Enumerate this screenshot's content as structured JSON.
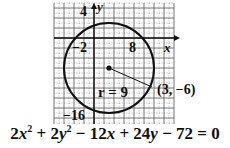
{
  "graph": {
    "pixel_box": {
      "left": 54,
      "top": 3,
      "right": 174,
      "bottom": 124
    },
    "x_range": [
      -8,
      16
    ],
    "y_range": [
      -17,
      7
    ],
    "unit_px": 5,
    "axis_origin_px": {
      "x": 94,
      "y": 38
    },
    "axis_labels": {
      "x": "x",
      "y": "y"
    },
    "tick_labels": [
      {
        "text": "4",
        "axis": "y",
        "value": 4
      },
      {
        "text": "−2",
        "axis": "x",
        "value": -2
      },
      {
        "text": "8",
        "axis": "x",
        "value": 8
      },
      {
        "text": "−16",
        "axis": "y",
        "value": -16
      }
    ],
    "circle": {
      "center": [
        3,
        -6
      ],
      "radius": 9,
      "color": "#111111"
    },
    "radius_label": "r = 9",
    "point_label": "(3, −6)",
    "radius_endpoint_px": [
      152,
      87
    ]
  },
  "equation": {
    "terms": [
      {
        "coef": "2",
        "var": "x",
        "exp": "2"
      },
      {
        "op": " + ",
        "coef": "2",
        "var": "y",
        "exp": "2"
      },
      {
        "op": " − ",
        "coef": "12",
        "var": "x"
      },
      {
        "op": " + ",
        "coef": "24",
        "var": "y"
      },
      {
        "op": " − ",
        "coef": "72"
      }
    ],
    "rhs": " = 0",
    "text": "2x² + 2y² − 12x + 24y − 72 = 0"
  }
}
